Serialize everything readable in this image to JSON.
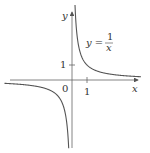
{
  "chart_data": {
    "type": "line",
    "title": "",
    "function": "y = 1/x",
    "equation_label": {
      "lhs": "y =",
      "numerator": "1",
      "denominator": "x"
    },
    "xlabel": "x",
    "ylabel": "y",
    "origin_label": "0",
    "x_ticks": [
      {
        "value": 1,
        "label": "1"
      }
    ],
    "y_ticks": [
      {
        "value": 1,
        "label": "1"
      }
    ],
    "xlim": [
      -4.6,
      4.8
    ],
    "ylim": [
      -4.9,
      4.9
    ],
    "grid": false,
    "series": [
      {
        "name": "y = 1/x (x > 0)",
        "x": [
          0.2,
          0.25,
          0.33,
          0.5,
          0.75,
          1,
          1.5,
          2,
          3,
          4,
          4.6
        ],
        "y": [
          5,
          4,
          3,
          2,
          1.33,
          1,
          0.67,
          0.5,
          0.33,
          0.25,
          0.22
        ]
      },
      {
        "name": "y = 1/x (x < 0)",
        "x": [
          -4.5,
          -4,
          -3,
          -2,
          -1.5,
          -1,
          -0.75,
          -0.5,
          -0.33,
          -0.25,
          -0.21
        ],
        "y": [
          -0.22,
          -0.25,
          -0.33,
          -0.5,
          -0.67,
          -1,
          -1.33,
          -2,
          -3,
          -4,
          -4.8
        ]
      }
    ],
    "curve_color": "#555555",
    "axis_color": "#555555"
  }
}
